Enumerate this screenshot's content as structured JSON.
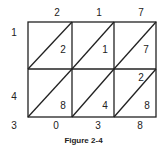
{
  "figure": {
    "caption": "Figure 2-4",
    "multiplicand_digits": [
      "2",
      "1",
      "7"
    ],
    "multiplier_digits": [
      "1",
      "4"
    ],
    "cells": [
      [
        {
          "tens": "",
          "ones": "2"
        },
        {
          "tens": "",
          "ones": "1"
        },
        {
          "tens": "",
          "ones": "7"
        }
      ],
      [
        {
          "tens": "",
          "ones": "8"
        },
        {
          "tens": "",
          "ones": "4"
        },
        {
          "tens": "2",
          "ones": "8"
        }
      ]
    ],
    "result_left": [
      "3"
    ],
    "result_bottom": [
      "0",
      "3",
      "8"
    ],
    "colors": {
      "line": "#222222",
      "text": "#222222"
    }
  }
}
